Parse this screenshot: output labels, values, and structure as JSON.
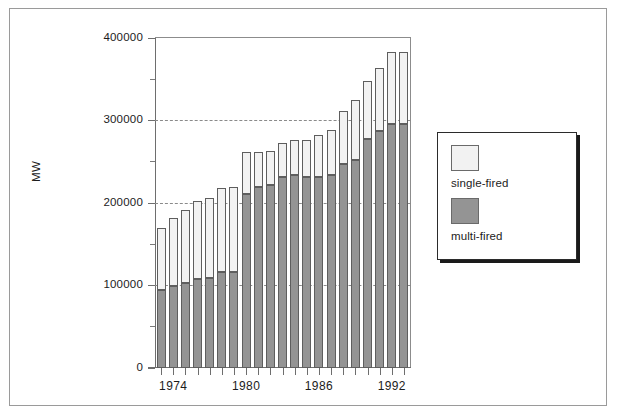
{
  "chart_data": {
    "type": "bar",
    "subtype": "stacked-vertical",
    "title": "",
    "xlabel": "",
    "ylabel": "MW",
    "ylim": [
      0,
      400000
    ],
    "ytick_values": [
      0,
      100000,
      200000,
      300000,
      400000
    ],
    "ytick_labels": [
      "0",
      "100000",
      "200000",
      "300000",
      "400000"
    ],
    "yminor_tick_values": [
      50000,
      150000,
      250000,
      350000
    ],
    "grid": "horizontal dashed at 100000, 200000, 300000",
    "legend_position": "right-outside",
    "categories": [
      1973,
      1974,
      1975,
      1976,
      1977,
      1978,
      1979,
      1980,
      1981,
      1982,
      1983,
      1984,
      1985,
      1986,
      1987,
      1988,
      1989,
      1990,
      1991,
      1992,
      1993
    ],
    "xtick_labeled": [
      "1974",
      "1980",
      "1986",
      "1992"
    ],
    "xtick_labeled_values": [
      1974,
      1980,
      1986,
      1992
    ],
    "series": [
      {
        "name": "multi-fired",
        "color": "#949494",
        "values": [
          94000,
          99000,
          103000,
          108000,
          109000,
          116000,
          116000,
          211000,
          219000,
          222000,
          232000,
          234000,
          232000,
          232000,
          234000,
          247000,
          252000,
          277000,
          287000,
          296000,
          296000
        ]
      },
      {
        "name": "single-fired",
        "color": "#f2f2f2",
        "values": [
          76000,
          83000,
          88000,
          94000,
          97000,
          102000,
          103000,
          51000,
          43000,
          41000,
          41000,
          42000,
          44000,
          50000,
          55000,
          65000,
          73000,
          71000,
          77000,
          87000,
          87000
        ]
      }
    ],
    "totals": [
      170000,
      182000,
      191000,
      202000,
      206000,
      218000,
      219000,
      262000,
      262000,
      263000,
      273000,
      276000,
      276000,
      282000,
      289000,
      312000,
      325000,
      348000,
      364000,
      383000,
      383000
    ]
  },
  "legend": {
    "items": [
      {
        "label": "single-fired",
        "swatch": "light-square-swatch",
        "color": "#f2f2f2"
      },
      {
        "label": "multi-fired",
        "swatch": "gray-square-swatch",
        "color": "#949494"
      }
    ]
  },
  "axes": {
    "y_title": "MW",
    "y_labels": [
      "400000",
      "300000",
      "200000",
      "100000",
      "0"
    ],
    "x_labels": [
      "1974",
      "1980",
      "1986",
      "1992"
    ]
  }
}
